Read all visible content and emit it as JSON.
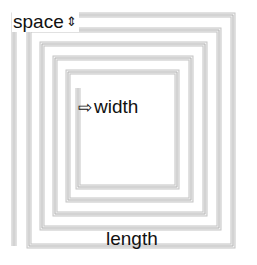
{
  "diagram": {
    "type": "square-spiral",
    "stroke_color": "#b4b4b4",
    "background": "#ffffff",
    "text_color": "#111111",
    "spiral_points": [
      [
        78,
        88
      ],
      [
        78,
        187
      ],
      [
        177,
        187
      ],
      [
        177,
        72
      ],
      [
        68,
        72
      ],
      [
        68,
        200
      ],
      [
        191,
        200
      ],
      [
        191,
        58
      ],
      [
        55,
        58
      ],
      [
        55,
        214
      ],
      [
        205,
        214
      ],
      [
        205,
        44
      ],
      [
        42,
        44
      ],
      [
        42,
        228
      ],
      [
        219,
        228
      ],
      [
        219,
        30
      ],
      [
        29,
        30
      ],
      [
        29,
        246
      ],
      [
        233,
        246
      ],
      [
        233,
        15
      ],
      [
        14,
        15
      ],
      [
        14,
        246
      ]
    ]
  },
  "labels": {
    "space": {
      "text": "space",
      "icon": "up-down-arrow-icon",
      "glyph": "⇕"
    },
    "width": {
      "text": "width",
      "icon": "right-arrow-outline-icon",
      "glyph": "⇨"
    },
    "length": {
      "text": "length"
    }
  }
}
